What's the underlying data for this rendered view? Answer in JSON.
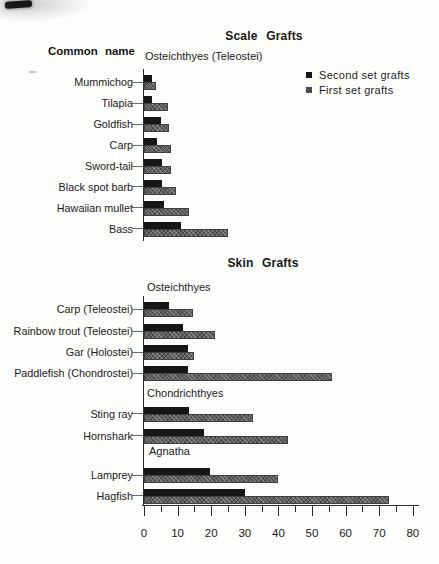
{
  "titles": {
    "scale_grafts": "Scale Grafts",
    "skin_grafts": "Skin Grafts",
    "common_name": "Common name"
  },
  "legend": {
    "items": [
      {
        "marker": "black-square",
        "label": "Second set grafts"
      },
      {
        "marker": "gray-square",
        "label": "First set grafts"
      }
    ]
  },
  "colors": {
    "second_set": "#171717",
    "first_set": "#5e5e5e",
    "axis": "#2b2b2b",
    "text": "#1e1e1e",
    "paper": "#fdfdfc"
  },
  "x_axis": {
    "range": [
      0,
      80
    ],
    "tick_labels": [
      "0",
      "10",
      "20",
      "30",
      "40",
      "50",
      "60",
      "70",
      "80"
    ],
    "major_tick_step": 10,
    "minor_tick_step": 5
  },
  "chart_data": [
    {
      "type": "bar",
      "orientation": "horizontal",
      "title": "Scale Grafts",
      "axis_label": "Common name",
      "group": "Osteichthyes (Teleostei)",
      "categories": [
        "Mummichog",
        "Tilapia",
        "Goldfish",
        "Carp",
        "Sword-tail",
        "Black spot barb",
        "Hawaiian mullet",
        "Bass"
      ],
      "series": [
        {
          "name": "Second set grafts",
          "values": [
            2.5,
            2.5,
            5,
            4,
            5.5,
            5.5,
            6,
            11
          ]
        },
        {
          "name": "First set grafts",
          "values": [
            3.5,
            7,
            7.5,
            8,
            8,
            9.5,
            13.5,
            25
          ]
        }
      ],
      "xlim": [
        0,
        80
      ],
      "legend_position": "upper right",
      "grid": false
    },
    {
      "type": "bar",
      "orientation": "horizontal",
      "title": "Skin Grafts",
      "groups": [
        {
          "name": "Osteichthyes",
          "categories": [
            "Carp (Teleostei)",
            "Rainbow trout (Teleostei)",
            "Gar (Holostei)",
            "Paddlefish (Chondrostei)"
          ],
          "series": [
            {
              "name": "Second set grafts",
              "values": [
                7.5,
                11.5,
                13,
                13
              ]
            },
            {
              "name": "First set grafts",
              "values": [
                14.5,
                21,
                15,
                56
              ]
            }
          ]
        },
        {
          "name": "Chondrichthyes",
          "categories": [
            "Sting ray",
            "Hornshark"
          ],
          "series": [
            {
              "name": "Second set grafts",
              "values": [
                13.5,
                18
              ]
            },
            {
              "name": "First set grafts",
              "values": [
                32.5,
                43
              ]
            }
          ]
        },
        {
          "name": "Agnatha",
          "categories": [
            "Lamprey",
            "Hagfish"
          ],
          "series": [
            {
              "name": "Second set grafts",
              "values": [
                19.5,
                30
              ]
            },
            {
              "name": "First set grafts",
              "values": [
                40,
                73
              ]
            }
          ]
        }
      ],
      "xlim": [
        0,
        80
      ],
      "grid": false
    }
  ]
}
